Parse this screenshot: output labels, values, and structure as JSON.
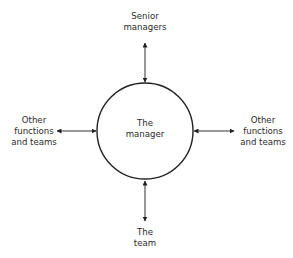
{
  "diagram": {
    "center": {
      "lines": [
        "The",
        "manager"
      ]
    },
    "nodes": {
      "top": {
        "lines": [
          "Senior",
          "managers"
        ]
      },
      "left": {
        "lines": [
          "Other",
          "functions",
          "and teams"
        ]
      },
      "right": {
        "lines": [
          "Other",
          "functions",
          "and teams"
        ]
      },
      "bottom": {
        "lines": [
          "The",
          "team"
        ]
      }
    },
    "connections": [
      {
        "from": "center",
        "to": "top",
        "type": "bidirectional-arrow"
      },
      {
        "from": "center",
        "to": "left",
        "type": "bidirectional-arrow"
      },
      {
        "from": "center",
        "to": "right",
        "type": "bidirectional-arrow"
      },
      {
        "from": "center",
        "to": "bottom",
        "type": "bidirectional-arrow"
      }
    ],
    "colors": {
      "stroke": "#222222",
      "text": "#2b2b2b",
      "background": "#ffffff"
    }
  }
}
